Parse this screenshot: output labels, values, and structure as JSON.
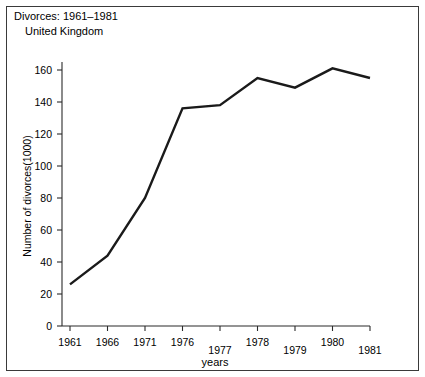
{
  "figure": {
    "title_line1": "Divorces: 1961–1981",
    "title_line2": "United Kingdom",
    "border_color": "#3a3a3a",
    "background": "#ffffff"
  },
  "axes": {
    "x_axis_title": "years",
    "y_axis_title": "Number of divorces(1000)",
    "y_ticks": [
      "0",
      "20",
      "40",
      "60",
      "80",
      "100",
      "120",
      "140",
      "160"
    ],
    "x_ticks": [
      "1961",
      "1966",
      "1971",
      "1976",
      "1977",
      "1978",
      "1979",
      "1980",
      "1981"
    ]
  },
  "chart_data": {
    "type": "line",
    "title": "Divorces: 1961–1981 United Kingdom",
    "xlabel": "years",
    "ylabel": "Number of divorces(1000)",
    "categories": [
      "1961",
      "1966",
      "1971",
      "1976",
      "1977",
      "1978",
      "1979",
      "1980",
      "1981"
    ],
    "values": [
      26,
      44,
      80,
      136,
      138,
      155,
      149,
      161,
      155
    ],
    "ylim": [
      0,
      170
    ],
    "ytick_values": [
      0,
      20,
      40,
      60,
      80,
      100,
      120,
      140,
      160
    ],
    "grid": false,
    "legend": "none",
    "series": [
      {
        "name": "Number of divorces (1000)",
        "color": "#1a1a1a",
        "values": [
          26,
          44,
          80,
          136,
          138,
          155,
          149,
          161,
          155
        ]
      }
    ]
  }
}
